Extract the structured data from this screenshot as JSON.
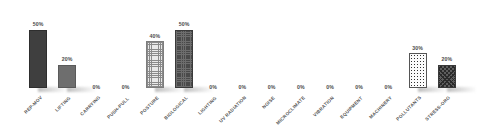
{
  "chart_data": {
    "type": "bar",
    "title": "",
    "subtitle": "",
    "xlabel": "",
    "ylabel": "",
    "ylim": [
      0,
      60
    ],
    "grid": false,
    "legend": "none",
    "value_suffix": "%",
    "categories": [
      "REP-MOV",
      "LIFTING",
      "CARRYING",
      "PUSH-PULL",
      "POSTURE",
      "BIOLOGICAL",
      "LIGHTING",
      "UV RADIATION",
      "NOISE",
      "MICROCLIMATE",
      "VIBRATION",
      "EQUIPMENT",
      "MACHINERY",
      "POLLUTANTS",
      "STRESS-ORG"
    ],
    "values": [
      50,
      20,
      0,
      0,
      40,
      50,
      0,
      0,
      0,
      0,
      0,
      0,
      0,
      30,
      20
    ],
    "value_labels": [
      "50%",
      "20%",
      "0%",
      "0%",
      "40%",
      "50%",
      "0%",
      "0%",
      "0%",
      "0%",
      "0%",
      "0%",
      "0%",
      "30%",
      "20%"
    ],
    "patterns": [
      "solid-dark",
      "solid-mid",
      "none",
      "none",
      "grid-light",
      "texture-dark",
      "none",
      "none",
      "none",
      "none",
      "none",
      "none",
      "none",
      "dotgrid",
      "diag-cross"
    ],
    "colors": {
      "solid_dark": "#3f3f3f",
      "solid_mid": "#6e6e6e",
      "grid_light": "#e9e9e9",
      "texture_dark": "#4a4a4a",
      "dotgrid": "#fbfbfb",
      "diag_cross": "#5e5e5e",
      "label_text": "#4a4a4a",
      "background": "#ffffff"
    }
  }
}
